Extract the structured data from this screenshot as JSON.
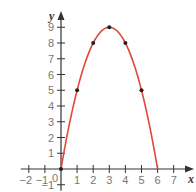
{
  "chart_data": {
    "type": "line",
    "title": "",
    "xlabel": "x",
    "ylabel": "y",
    "equation": "y = -x^2 + 6x",
    "xlim": [
      -2,
      7
    ],
    "ylim": [
      -1,
      9
    ],
    "x_ticks": [
      -2,
      -1,
      1,
      2,
      3,
      4,
      5,
      6,
      7
    ],
    "y_ticks": [
      -1,
      1,
      2,
      3,
      4,
      5,
      6,
      7,
      8,
      9
    ],
    "origin_label": "0",
    "grid": false,
    "series": [
      {
        "name": "parabola",
        "color": "#e0483a",
        "x": [
          0,
          1,
          2,
          3,
          4,
          5,
          6
        ],
        "values": [
          0,
          5,
          8,
          9,
          8,
          5,
          0
        ]
      }
    ],
    "marked_points": [
      [
        0,
        0
      ],
      [
        1,
        5
      ],
      [
        2,
        8
      ],
      [
        3,
        9
      ],
      [
        4,
        8
      ],
      [
        5,
        5
      ]
    ]
  },
  "colors": {
    "axis": "#333333",
    "curve": "#e0483a",
    "point": "#222222",
    "tick_label": "#777777"
  }
}
